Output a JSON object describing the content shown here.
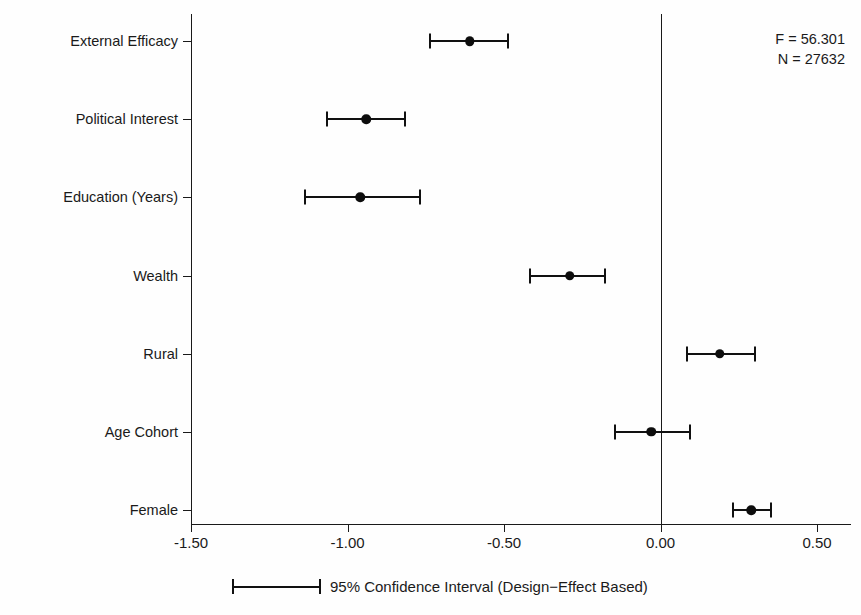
{
  "chart_data": {
    "type": "scatter",
    "title": "",
    "subtitle": "",
    "xlabel": "",
    "ylabel": "",
    "xlim": [
      -1.5,
      0.5
    ],
    "grid": false,
    "orientation": "horizontal",
    "zero_reference_line": 0.0,
    "xticks": [
      -1.5,
      -1.0,
      -0.5,
      0.0,
      0.5
    ],
    "xtick_labels": [
      "-1.50",
      "-1.00",
      "-0.50",
      "0.00",
      "0.50"
    ],
    "categories": [
      "External Efficacy",
      "Political Interest",
      "Education (Years)",
      "Wealth",
      "Rural",
      "Age Cohort",
      "Female"
    ],
    "points": [
      {
        "label": "External Efficacy",
        "estimate": -0.61,
        "ci_low": -0.74,
        "ci_high": -0.49
      },
      {
        "label": "Political Interest",
        "estimate": -0.94,
        "ci_low": -1.07,
        "ci_high": -0.82
      },
      {
        "label": "Education (Years)",
        "estimate": -0.96,
        "ci_low": -1.14,
        "ci_high": -0.77
      },
      {
        "label": "Wealth",
        "estimate": -0.29,
        "ci_low": -0.42,
        "ci_high": -0.18
      },
      {
        "label": "Rural",
        "estimate": 0.19,
        "ci_low": 0.08,
        "ci_high": 0.3
      },
      {
        "label": "Age Cohort",
        "estimate": -0.03,
        "ci_low": -0.15,
        "ci_high": 0.09
      },
      {
        "label": "Female",
        "estimate": 0.29,
        "ci_low": 0.23,
        "ci_high": 0.35
      }
    ],
    "annotations": [
      "F = 56.301",
      "N = 27632"
    ],
    "legend": {
      "position": "bottom",
      "entries": [
        {
          "label": "95% Confidence Interval (Design−Effect Based)",
          "marker": "capped-line"
        }
      ]
    },
    "colors": {
      "marker": "#0d0d0d",
      "line": "#111111",
      "axis": "#1a1a1a",
      "background": "#fefefe"
    }
  },
  "stats": {
    "f_statistic": "F = 56.301",
    "n_observations": "N = 27632"
  },
  "legend": {
    "caption": "95% Confidence Interval (Design−Effect Based)"
  }
}
